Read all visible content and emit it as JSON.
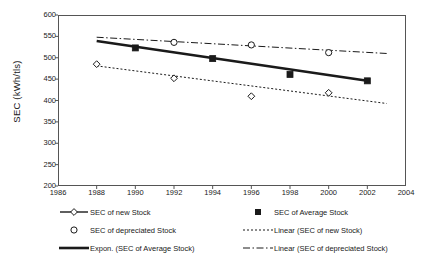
{
  "chart_data": {
    "type": "scatter",
    "title": "",
    "xlabel": "",
    "ylabel": "SEC (kWh/tls)",
    "xlim": [
      1986,
      2004
    ],
    "ylim": [
      200,
      600
    ],
    "xticks": [
      1986,
      1988,
      1990,
      1992,
      1994,
      1996,
      1998,
      2000,
      2002,
      2004
    ],
    "yticks": [
      200,
      250,
      300,
      350,
      400,
      450,
      500,
      550,
      600
    ],
    "grid": false,
    "legend_position": "bottom",
    "series": [
      {
        "name": "SEC of new Stock",
        "marker": "open-diamond",
        "style": "markers",
        "x": [
          1988,
          1992,
          1996,
          2000
        ],
        "values": [
          485,
          452,
          410,
          418
        ]
      },
      {
        "name": "SEC of Average Stock",
        "marker": "filled-square",
        "style": "markers",
        "x": [
          1990,
          1994,
          1998,
          2002
        ],
        "values": [
          523,
          498,
          461,
          446
        ]
      },
      {
        "name": "SEC of depreciated Stock",
        "marker": "open-circle",
        "style": "markers",
        "x": [
          1992,
          1996,
          2000
        ],
        "values": [
          536,
          530,
          512
        ]
      },
      {
        "name": "Expon. (SEC of Average Stock)",
        "marker": "none",
        "style": "solid-thick",
        "x": [
          1988,
          2002
        ],
        "values": [
          539,
          446
        ]
      },
      {
        "name": "Linear (SEC of new Stock)",
        "marker": "none",
        "style": "dotted",
        "x": [
          1988,
          2003
        ],
        "values": [
          481,
          393
        ]
      },
      {
        "name": "Linear (SEC of depreciated Stock)",
        "marker": "none",
        "style": "dash-dot",
        "x": [
          1988,
          2003
        ],
        "values": [
          548,
          510
        ]
      }
    ]
  },
  "legend": {
    "left": [
      {
        "label": "SEC of new Stock",
        "key": "line-open-diamond"
      },
      {
        "label": "SEC of depreciated Stock",
        "key": "open-circle"
      },
      {
        "label": "Expon. (SEC of Average Stock)",
        "key": "solid-thick-line"
      }
    ],
    "right": [
      {
        "label": "SEC of Average Stock",
        "key": "filled-square"
      },
      {
        "label": "Linear (SEC of new Stock)",
        "key": "dotted-line"
      },
      {
        "label": "Linear (SEC of depreciated Stock)",
        "key": "dash-dot-line"
      }
    ]
  },
  "colors": {
    "axis": "#555555",
    "ink": "#1a1a1a",
    "background": "#ffffff"
  }
}
